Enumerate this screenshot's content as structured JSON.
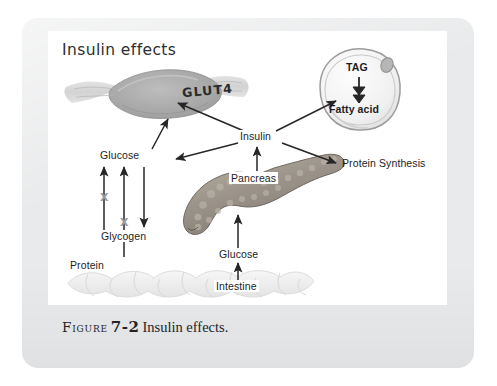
{
  "figure": {
    "title": "Insulin effects",
    "caption_label": "Figure",
    "caption_number": "7-2",
    "caption_text": "Insulin effects."
  },
  "labels": {
    "glut4": "GLUT4",
    "tag": "TAG",
    "fatty_acid": "Fatty acid",
    "insulin": "Insulin",
    "pancreas": "Pancreas",
    "protein_synthesis": "Protein Synthesis",
    "glucose_muscle": "Glucose",
    "glycogen": "Glycogen",
    "protein": "Protein",
    "glucose_gut": "Glucose",
    "intestine": "Intestine",
    "inhibit_mark_1": "X",
    "inhibit_mark_2": "X"
  },
  "colors": {
    "page_background": "#e9eaeb",
    "panel_background": "#ffffff",
    "ink": "#1d1d1f",
    "arrow": "#262628",
    "inhibit_mark": "#9a9a9c",
    "muscle_fill": "#a9a9a9",
    "pancreas_fill": "#9d958a",
    "adipocyte_fill": "#f2f2f2",
    "intestine_fill": "#eeeeee"
  },
  "diagram": {
    "type": "concept-map",
    "nodes": [
      {
        "id": "muscle",
        "label": "GLUT4",
        "kind": "organ",
        "organ": "skeletal-muscle-fiber"
      },
      {
        "id": "adipocyte",
        "label": "TAG / Fatty acid",
        "kind": "organ",
        "organ": "fat-cell"
      },
      {
        "id": "insulin",
        "label": "Insulin",
        "kind": "text"
      },
      {
        "id": "pancreas",
        "label": "Pancreas",
        "kind": "organ",
        "organ": "pancreas"
      },
      {
        "id": "protsyn",
        "label": "Protein Synthesis",
        "kind": "text"
      },
      {
        "id": "glucose1",
        "label": "Glucose",
        "kind": "text"
      },
      {
        "id": "glycogen",
        "label": "Glycogen",
        "kind": "text"
      },
      {
        "id": "protein",
        "label": "Protein",
        "kind": "text"
      },
      {
        "id": "glucose2",
        "label": "Glucose",
        "kind": "text"
      },
      {
        "id": "intestine",
        "label": "Intestine",
        "kind": "organ",
        "organ": "small-intestine"
      }
    ],
    "edges": [
      {
        "from": "insulin",
        "to": "muscle",
        "style": "arrow"
      },
      {
        "from": "insulin",
        "to": "adipocyte",
        "style": "arrow"
      },
      {
        "from": "insulin",
        "to": "protsyn",
        "style": "arrow"
      },
      {
        "from": "insulin",
        "to": "glucose1",
        "style": "arrow"
      },
      {
        "from": "pancreas",
        "to": "insulin",
        "style": "arrow"
      },
      {
        "from": "glucose2",
        "to": "pancreas",
        "style": "arrow"
      },
      {
        "from": "intestine",
        "to": "glucose2",
        "style": "arrow"
      },
      {
        "from": "glucose1",
        "to": "muscle",
        "style": "arrow"
      },
      {
        "from": "glycogen",
        "to": "glucose1",
        "style": "arrow",
        "mark": "X"
      },
      {
        "from": "glucose1",
        "to": "glycogen",
        "style": "arrow"
      },
      {
        "from": "protein",
        "to": "glucose1",
        "style": "arrow",
        "mark": "X"
      },
      {
        "from": "tag",
        "to": "fatty_acid",
        "style": "double-arrow"
      }
    ]
  }
}
